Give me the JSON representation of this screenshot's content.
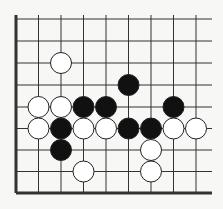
{
  "board": {
    "type": "go-diagram",
    "columns": 9,
    "rows": 9,
    "col_x": [
      16,
      38.5,
      61,
      83.5,
      106,
      128.5,
      151,
      173.5,
      196
    ],
    "row_y": [
      19,
      41,
      63,
      85,
      107,
      128.5,
      150,
      171.5,
      193
    ],
    "line_extent": {
      "top": 15,
      "right": 212
    },
    "thick_edges": [
      "left",
      "bottom"
    ],
    "colors": {
      "background": "#f7f7f5",
      "line": "#333333",
      "black_stone": "#111111",
      "white_stone": "#ffffff",
      "stone_outline": "#222222"
    },
    "stone_radius": 10.5
  },
  "stones": [
    {
      "color": "white",
      "col": 2,
      "row": 2
    },
    {
      "color": "black",
      "col": 5,
      "row": 3
    },
    {
      "color": "white",
      "col": 1,
      "row": 4
    },
    {
      "color": "white",
      "col": 2,
      "row": 4
    },
    {
      "color": "black",
      "col": 3,
      "row": 4
    },
    {
      "color": "black",
      "col": 4,
      "row": 4
    },
    {
      "color": "black",
      "col": 7,
      "row": 4
    },
    {
      "color": "white",
      "col": 1,
      "row": 5
    },
    {
      "color": "black",
      "col": 2,
      "row": 5
    },
    {
      "color": "white",
      "col": 3,
      "row": 5
    },
    {
      "color": "white",
      "col": 4,
      "row": 5
    },
    {
      "color": "black",
      "col": 5,
      "row": 5
    },
    {
      "color": "black",
      "col": 6,
      "row": 5
    },
    {
      "color": "white",
      "col": 7,
      "row": 5
    },
    {
      "color": "white",
      "col": 8,
      "row": 5
    },
    {
      "color": "black",
      "col": 2,
      "row": 6
    },
    {
      "color": "white",
      "col": 6,
      "row": 6
    },
    {
      "color": "white",
      "col": 3,
      "row": 7
    },
    {
      "color": "white",
      "col": 6,
      "row": 7
    }
  ]
}
